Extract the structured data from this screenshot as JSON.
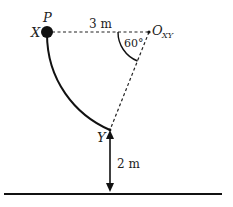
{
  "diagram": {
    "points": {
      "P": {
        "label": "P"
      },
      "X": {
        "label": "X"
      },
      "Y": {
        "label": "Y"
      },
      "O": {
        "label": "O",
        "subscript": "XY"
      }
    },
    "labels": {
      "horizontal_distance": "3 m",
      "angle": "60°",
      "height": "2 m"
    },
    "colors": {
      "ink": "#111111",
      "background": "#ffffff"
    }
  }
}
